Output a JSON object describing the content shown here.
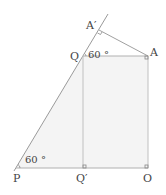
{
  "diagram": {
    "points": {
      "A_prime": {
        "label": "A′",
        "x": 99,
        "y": 30
      },
      "Q": {
        "label": "Q",
        "x": 83,
        "y": 56
      },
      "A": {
        "label": "A",
        "x": 148,
        "y": 56
      },
      "P": {
        "label": "P",
        "x": 16,
        "y": 168
      },
      "Q_prime": {
        "label": "Q′",
        "x": 83,
        "y": 168
      },
      "O": {
        "label": "O",
        "x": 148,
        "y": 168
      }
    },
    "angles": {
      "at_Q": "60 °",
      "at_P": "60 °"
    },
    "colors": {
      "line": "#9a9a9a",
      "fill": "#f4f4f4",
      "text": "#444444"
    }
  }
}
